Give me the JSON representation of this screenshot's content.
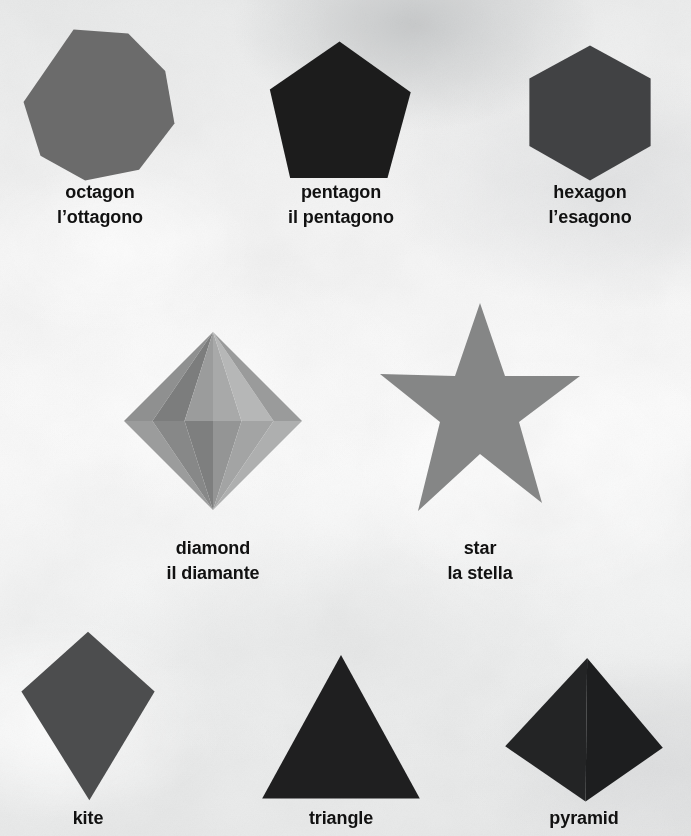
{
  "poster": {
    "kind": "shapes-vocabulary-poster",
    "languages": [
      "English",
      "Italian"
    ],
    "background_color": "#f1f2f2",
    "text_color": "#111111"
  },
  "shapes": [
    {
      "id": "octagon",
      "label_en": "octagon",
      "label_it": "l’ottagono",
      "color": "#6b6b6b",
      "geometry": "regular-octagon",
      "box": {
        "x": 22,
        "y": 28,
        "w": 154,
        "h": 154
      },
      "label_pos": {
        "x": 12,
        "y": 180,
        "w": 176
      }
    },
    {
      "id": "pentagon",
      "label_en": "pentagon",
      "label_it": "il pentagono",
      "color": "#1c1c1c",
      "geometry": "regular-pentagon",
      "box": {
        "x": 268,
        "y": 40,
        "w": 146,
        "h": 138
      },
      "label_pos": {
        "x": 253,
        "y": 180,
        "w": 176
      }
    },
    {
      "id": "hexagon",
      "label_en": "hexagon",
      "label_it": "l’esagono",
      "color": "#414244",
      "geometry": "regular-hexagon-pointy",
      "box": {
        "x": 528,
        "y": 44,
        "w": 124,
        "h": 138
      },
      "label_pos": {
        "x": 502,
        "y": 180,
        "w": 176
      }
    },
    {
      "id": "diamond",
      "label_en": "diamond",
      "label_it": "il diamante",
      "color": "#8e8e8e",
      "geometry": "faceted-octahedron-bipyramid",
      "box": {
        "x": 124,
        "y": 332,
        "w": 178,
        "h": 178
      },
      "label_pos": {
        "x": 125,
        "y": 536,
        "w": 176
      },
      "facets": [
        {
          "name": "top-far-left",
          "fill": "#8f9090"
        },
        {
          "name": "top-left",
          "fill": "#7c7d7d"
        },
        {
          "name": "top-mid-left",
          "fill": "#9b9c9c"
        },
        {
          "name": "top-mid-right",
          "fill": "#a8a9a9"
        },
        {
          "name": "top-right",
          "fill": "#b6b7b7"
        },
        {
          "name": "top-far-right",
          "fill": "#9a9b9b"
        },
        {
          "name": "bot-far-left",
          "fill": "#9b9c9c"
        },
        {
          "name": "bot-left",
          "fill": "#878888"
        },
        {
          "name": "bot-mid-left",
          "fill": "#7e7f7f"
        },
        {
          "name": "bot-mid-right",
          "fill": "#949595"
        },
        {
          "name": "bot-right",
          "fill": "#a3a4a4"
        },
        {
          "name": "bot-far-right",
          "fill": "#aeafaf"
        }
      ]
    },
    {
      "id": "star",
      "label_en": "star",
      "label_it": "la stella",
      "color": "#858686",
      "geometry": "five-point-star",
      "box": {
        "x": 380,
        "y": 303,
        "w": 200,
        "h": 208
      },
      "label_pos": {
        "x": 392,
        "y": 536,
        "w": 176
      }
    },
    {
      "id": "kite",
      "label_en": "kite",
      "label_it": "",
      "color": "#4c4d4e",
      "geometry": "kite-quadrilateral",
      "box": {
        "x": 20,
        "y": 630,
        "w": 136,
        "h": 172
      },
      "label_pos": {
        "x": 0,
        "y": 806,
        "w": 176
      }
    },
    {
      "id": "triangle",
      "label_en": "triangle",
      "label_it": "",
      "color": "#1f1f20",
      "geometry": "equilateral-triangle",
      "box": {
        "x": 262,
        "y": 655,
        "w": 158,
        "h": 145
      },
      "label_pos": {
        "x": 253,
        "y": 806,
        "w": 176
      }
    },
    {
      "id": "pyramid",
      "label_en": "pyramid",
      "label_it": "",
      "color": "#232425",
      "geometry": "square-pyramid-3d",
      "box": {
        "x": 505,
        "y": 658,
        "w": 158,
        "h": 145
      },
      "label_pos": {
        "x": 496,
        "y": 806,
        "w": 176
      }
    }
  ]
}
